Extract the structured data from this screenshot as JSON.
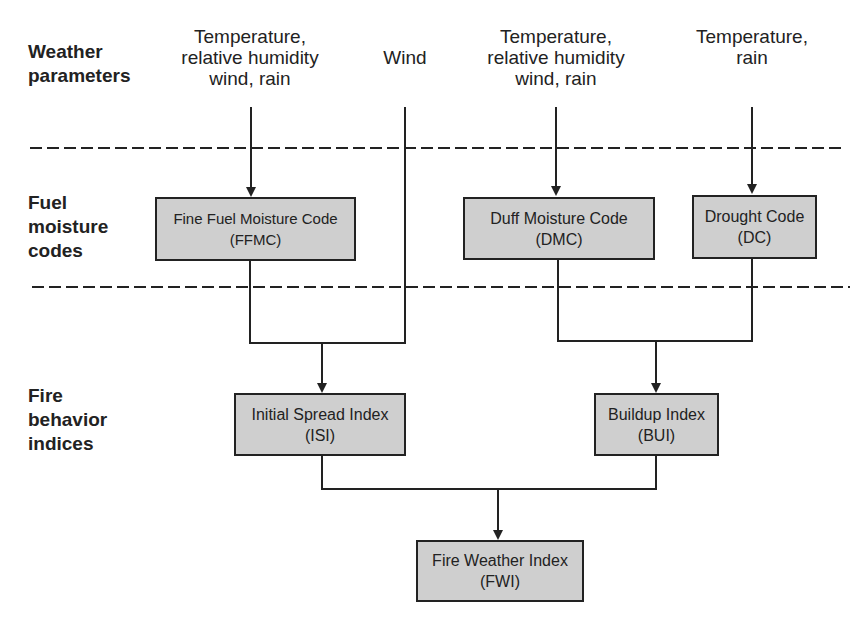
{
  "rows": {
    "weather": "Weather\nparameters",
    "fuel": "Fuel\nmoisture\ncodes",
    "fire": "Fire\nbehavior\nindices"
  },
  "parameters": {
    "ffmc_inputs": "Temperature,\nrelative humidity\nwind, rain",
    "wind": "Wind",
    "dmc_inputs": "Temperature,\nrelative humidity\nwind, rain",
    "dc_inputs": "Temperature,\nrain"
  },
  "boxes": {
    "ffmc": {
      "name": "Fine Fuel Moisture Code",
      "abbr": "(FFMC)"
    },
    "dmc": {
      "name": "Duff Moisture Code",
      "abbr": "(DMC)"
    },
    "dc": {
      "name": "Drought Code",
      "abbr": "(DC)"
    },
    "isi": {
      "name": "Initial Spread Index",
      "abbr": "(ISI)"
    },
    "bui": {
      "name": "Buildup Index",
      "abbr": "(BUI)"
    },
    "fwi": {
      "name": "Fire Weather Index",
      "abbr": "(FWI)"
    }
  },
  "colors": {
    "box_fill": "#cfcfcf",
    "line": "#222222"
  }
}
